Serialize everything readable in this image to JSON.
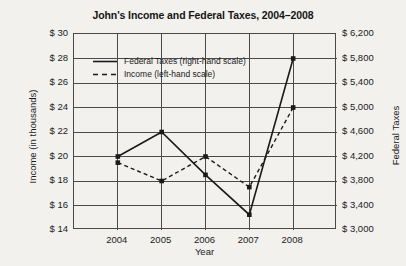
{
  "chart_data": {
    "type": "line",
    "title": "John's Income and Federal Taxes, 2004–2008",
    "xlabel": "Year",
    "ylabel": "Income (in thousands)",
    "ylabel_right": "Federal Taxes",
    "categories": [
      "2004",
      "2005",
      "2006",
      "2007",
      "2008"
    ],
    "grid": true,
    "legend_position": "inside-top-center",
    "ylim": [
      14,
      30
    ],
    "ytick_step": 2,
    "yticks": [
      "$ 14",
      "$ 16",
      "$ 18",
      "$ 20",
      "$ 22",
      "$ 24",
      "$ 26",
      "$ 28",
      "$ 30"
    ],
    "ylim_right": [
      3000,
      6200
    ],
    "ytick_step_right": 400,
    "yticks_right": [
      "$ 3,000",
      "$ 3,400",
      "$ 3,800",
      "$ 4,200",
      "$ 4,600",
      "$ 5,000",
      "$ 5,400",
      "$ 5,800",
      "$ 6,200"
    ],
    "series": [
      {
        "name": "Federal Taxes (right-hand scale)",
        "axis": "right",
        "style": "solid",
        "color": "#1a1a1a",
        "values": [
          4200,
          4600,
          3900,
          3250,
          5800
        ]
      },
      {
        "name": "Income (left-hand scale)",
        "axis": "left",
        "style": "dashed",
        "color": "#1a1a1a",
        "values": [
          19.5,
          18,
          20,
          17.5,
          24
        ]
      }
    ]
  },
  "legend": {
    "items": [
      {
        "label": "Federal Taxes (right-hand scale)",
        "style": "solid"
      },
      {
        "label": "Income (left-hand scale)",
        "style": "dashed"
      }
    ]
  }
}
